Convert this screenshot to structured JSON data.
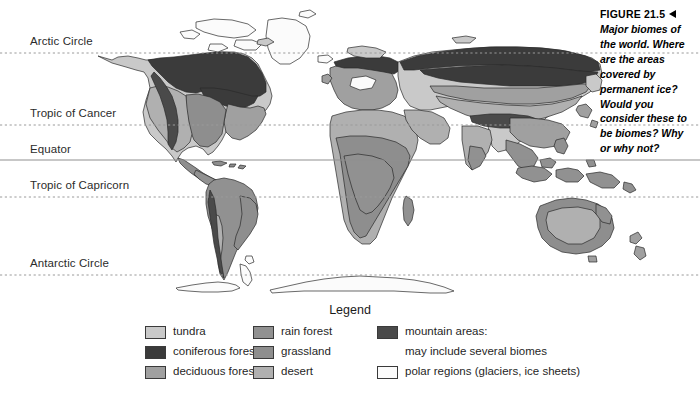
{
  "figure": {
    "number_label": "FIGURE 21.5",
    "arrow_icon": "left-triangle-icon",
    "caption": "Major biomes of the world. Where are the areas covered by permanent ice? Would you consider these to be biomes? Why or why not?"
  },
  "map": {
    "title": "Major biomes of the world",
    "projection": "world-mercator-style",
    "latitude_lines": [
      {
        "label": "Arctic Circle",
        "y": 53,
        "style": "dashed",
        "latitude": "66.5N"
      },
      {
        "label": "Tropic of Cancer",
        "y": 125,
        "style": "dashed",
        "latitude": "23.5N"
      },
      {
        "label": "Equator",
        "y": 160,
        "style": "solid",
        "latitude": "0"
      },
      {
        "label": "Tropic of Capricorn",
        "y": 197,
        "style": "dashed",
        "latitude": "23.5S"
      },
      {
        "label": "Antarctic Circle",
        "y": 275,
        "style": "dashed",
        "latitude": "66.5S"
      }
    ],
    "label_x": 30
  },
  "legend": {
    "title": "Legend",
    "columns": [
      {
        "items": [
          {
            "label": "tundra",
            "color": "#c9c9c9",
            "swatch": true
          },
          {
            "label": "coniferous forest",
            "color": "#3b3b3b",
            "swatch": true
          },
          {
            "label": "deciduous forest",
            "color": "#a0a0a0",
            "swatch": true
          }
        ]
      },
      {
        "items": [
          {
            "label": "rain forest",
            "color": "#919191",
            "swatch": true
          },
          {
            "label": "grassland",
            "color": "#8e8e8e",
            "swatch": true
          },
          {
            "label": "desert",
            "color": "#b0b0b0",
            "swatch": true
          }
        ]
      },
      {
        "items": [
          {
            "label": "mountain areas:",
            "color": "#4a4a4a",
            "swatch": true
          },
          {
            "label": "may include several biomes",
            "color": null,
            "swatch": false
          },
          {
            "label": "polar regions (glaciers, ice sheets)",
            "color": "#fbfbfb",
            "swatch": true
          }
        ]
      }
    ]
  },
  "colors": {
    "tundra": "#c9c9c9",
    "coniferous_forest": "#3b3b3b",
    "deciduous_forest": "#a0a0a0",
    "rain_forest": "#919191",
    "grassland": "#8e8e8e",
    "desert": "#b0b0b0",
    "mountain": "#4a4a4a",
    "polar": "#fbfbfb",
    "outline": "#2a2a2a",
    "background": "#ffffff",
    "latitude_line": "#9a9a9a"
  }
}
